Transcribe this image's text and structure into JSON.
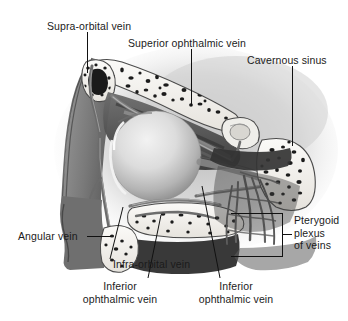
{
  "figure": {
    "background_color": "#ffffff",
    "ink_color": "#111111",
    "text_color": "#1b1b1b",
    "width": 348,
    "height": 321
  },
  "labels": {
    "supra_orbital_vein": "Supra-orbital vein",
    "superior_ophthalmic_vein": "Superior ophthalmic vein",
    "cavernous_sinus": "Cavernous sinus",
    "angular_vein": "Angular vein",
    "pterygoid_plexus_line1": "Pterygoid",
    "pterygoid_plexus_line2": "plexus",
    "pterygoid_plexus_line3": "of veins",
    "infra_orbital_vein": "Infra-orbital vein",
    "inferior_ophthalmic_vein_left_line1": "Inferior",
    "inferior_ophthalmic_vein_left_line2": "ophthalmic vein",
    "inferior_ophthalmic_vein_right_line1": "Inferior",
    "inferior_ophthalmic_vein_right_line2": "ophthalmic vein"
  },
  "structures": {
    "eyeball": "eyeball-globe",
    "orbital_roof_bone": "frontal-bone-cancellous",
    "sphenoid_bone": "sphenoid-bone-cancellous",
    "maxilla_bone": "maxilla-cancellous",
    "soft_tissue": "orbital-soft-tissue",
    "vein_network": "venous-plexus-network"
  },
  "palette": {
    "bone_fill": "#f4f2ee",
    "bone_outline": "#4a4a4a",
    "trabecula": "#1f1f1f",
    "soft_tissue_dark": "#3a3a3a",
    "soft_tissue_mid": "#6e6e6e",
    "soft_tissue_light": "#a8a8a8",
    "globe_light": "#e4e4e4",
    "globe_shadow": "#9a9a9a",
    "vein": "#5c5c5c",
    "background_haze": "#d9d9d9"
  }
}
